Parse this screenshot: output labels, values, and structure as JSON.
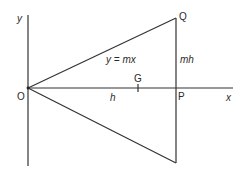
{
  "diagram": {
    "type": "geometry",
    "colors": {
      "line": "#333333",
      "text": "#2a2a2a",
      "background": "#ffffff"
    },
    "axes": {
      "x_label": "x",
      "y_label": "y",
      "origin_label": "O"
    },
    "points": {
      "Q": {
        "label": "Q",
        "x": 176,
        "y": 18
      },
      "P": {
        "label": "P",
        "x": 176,
        "y": 88
      },
      "O": {
        "label": "O",
        "x": 28,
        "y": 88
      },
      "G": {
        "label": "G",
        "x": 138,
        "y": 88
      },
      "bottom": {
        "label": "",
        "x": 176,
        "y": 163
      }
    },
    "labels": {
      "line_equation": "y = mx",
      "height_segment": "mh",
      "base_segment": "h",
      "centroid": "G"
    }
  }
}
